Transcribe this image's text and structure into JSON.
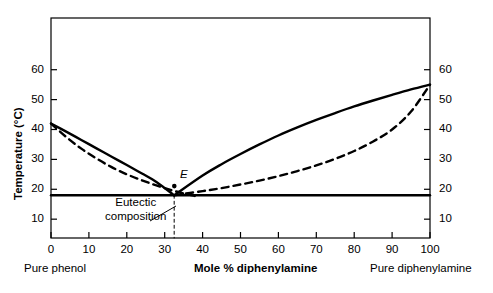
{
  "chart_data": {
    "type": "line",
    "title": "",
    "xlabel": "Mole % diphenylamine",
    "ylabel": "Temperature (°C)",
    "xlim": [
      0,
      100
    ],
    "ylim": [
      3.7,
      77.3
    ],
    "grid": false,
    "legend": "none",
    "x_ticks": [
      0,
      10,
      20,
      30,
      40,
      50,
      60,
      70,
      80,
      90,
      100
    ],
    "x_tick_labels": [
      "0",
      "10",
      "20",
      "30",
      "40",
      "50",
      "60",
      "70",
      "80",
      "90",
      "100"
    ],
    "y_ticks": [
      10,
      20,
      30,
      40,
      50,
      60
    ],
    "y_tick_labels_left": [
      "10",
      "20",
      "30",
      "40",
      "50",
      "60"
    ],
    "y_tick_labels_right": [
      "10",
      "20",
      "30",
      "40",
      "50",
      "60"
    ],
    "right_axis_label": "",
    "axis_end_labels": {
      "left": "Pure phenol",
      "right": "Pure diphenylamine"
    },
    "annotations": [
      {
        "name": "eutectic-point-label",
        "text": "E",
        "x": 33.5,
        "y": 21.5,
        "style": "italic"
      },
      {
        "name": "eutectic-composition-note",
        "text": "Eutectic composition",
        "lines": [
          "Eutectic",
          "composition"
        ],
        "x": 17,
        "y": 11.5
      }
    ],
    "eutectic_point": {
      "x": 32.5,
      "y": 18.0
    },
    "eutectic_temperature": 18.0,
    "series": [
      {
        "name": "liquidus-phenol-branch",
        "style": "solid",
        "color": "#000000",
        "points": [
          [
            0,
            42.0
          ],
          [
            4,
            39.3
          ],
          [
            8,
            36.5
          ],
          [
            12,
            33.7
          ],
          [
            16,
            30.9
          ],
          [
            20,
            28.1
          ],
          [
            24,
            25.3
          ],
          [
            28,
            22.3
          ],
          [
            32.5,
            18.0
          ]
        ]
      },
      {
        "name": "liquidus-diphenylamine-branch",
        "style": "solid",
        "color": "#000000",
        "points": [
          [
            32.5,
            18.0
          ],
          [
            40,
            24.6
          ],
          [
            45,
            28.4
          ],
          [
            50,
            31.8
          ],
          [
            55,
            35.0
          ],
          [
            60,
            38.0
          ],
          [
            65,
            40.7
          ],
          [
            70,
            43.2
          ],
          [
            75,
            45.5
          ],
          [
            80,
            47.7
          ],
          [
            85,
            49.7
          ],
          [
            90,
            51.6
          ],
          [
            95,
            53.4
          ],
          [
            100,
            55.0
          ]
        ]
      },
      {
        "name": "ideal-solubility-phenol-branch",
        "style": "dashed",
        "color": "#000000",
        "points": [
          [
            0,
            42.0
          ],
          [
            4,
            37.5
          ],
          [
            8,
            33.6
          ],
          [
            12,
            30.3
          ],
          [
            16,
            27.4
          ],
          [
            20,
            25.0
          ],
          [
            24,
            23.0
          ],
          [
            28,
            21.2
          ],
          [
            32,
            19.6
          ],
          [
            36,
            18.3
          ],
          [
            39,
            17.5
          ]
        ]
      },
      {
        "name": "ideal-solubility-diphenylamine-branch",
        "style": "dashed",
        "color": "#000000",
        "points": [
          [
            32.5,
            18.0
          ],
          [
            40,
            19.4
          ],
          [
            45,
            20.4
          ],
          [
            50,
            21.6
          ],
          [
            55,
            22.9
          ],
          [
            60,
            24.4
          ],
          [
            65,
            26.1
          ],
          [
            70,
            28.0
          ],
          [
            75,
            30.2
          ],
          [
            80,
            32.8
          ],
          [
            85,
            36.0
          ],
          [
            90,
            40.0
          ],
          [
            95,
            46.0
          ],
          [
            100,
            55.0
          ]
        ]
      },
      {
        "name": "eutectic-horizontal-line",
        "style": "solid",
        "color": "#000000",
        "points": [
          [
            0,
            18.0
          ],
          [
            100,
            18.0
          ]
        ]
      },
      {
        "name": "eutectic-composition-vertical-line",
        "style": "dashed",
        "color": "#000000",
        "points": [
          [
            32.5,
            18.0
          ],
          [
            32.5,
            3.7
          ]
        ]
      }
    ]
  },
  "axes": {
    "frame_color": "#000000",
    "tick_color": "#000000"
  }
}
